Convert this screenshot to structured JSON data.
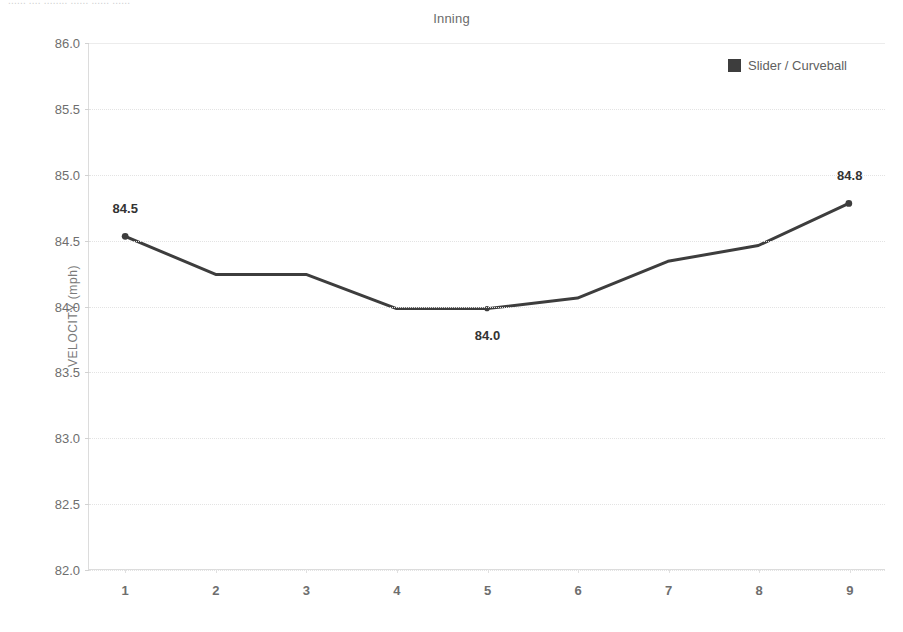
{
  "top_strip": {
    "text": "......  ....  ........  ......  ......  ......"
  },
  "chart": {
    "title": "Inning",
    "y_axis_title": "VELOCITY (mph)",
    "legend": {
      "label": "Slider / Curveball",
      "color": "#3d3d3d"
    }
  },
  "chart_data": {
    "type": "line",
    "title": "Inning",
    "xlabel": "Inning",
    "ylabel": "VELOCITY (mph)",
    "xlim": [
      0.6,
      9.4
    ],
    "ylim": [
      82.0,
      86.0
    ],
    "grid": true,
    "legend_position": "top-right",
    "x": [
      1,
      2,
      3,
      4,
      5,
      6,
      7,
      8,
      9
    ],
    "xtick_labels": [
      "1",
      "2",
      "3",
      "4",
      "5",
      "6",
      "7",
      "8",
      "9"
    ],
    "ytick_labels": [
      "86.0",
      "85.5",
      "85.0",
      "84.5",
      "84.0",
      "83.5",
      "83.0",
      "82.5",
      "82.0"
    ],
    "ytick_values": [
      86.0,
      85.5,
      85.0,
      84.5,
      84.0,
      83.5,
      83.0,
      82.5,
      82.0
    ],
    "series": [
      {
        "name": "Slider / Curveball",
        "color": "#3d3d3d",
        "values": [
          84.53,
          84.24,
          84.24,
          83.98,
          83.98,
          84.06,
          84.34,
          84.46,
          84.78
        ]
      }
    ],
    "point_labels": [
      {
        "x": 1,
        "value": 84.53,
        "text": "84.5",
        "position": "above"
      },
      {
        "x": 5,
        "value": 83.98,
        "text": "84.0",
        "position": "below"
      },
      {
        "x": 9,
        "value": 84.78,
        "text": "84.8",
        "position": "above"
      }
    ]
  }
}
